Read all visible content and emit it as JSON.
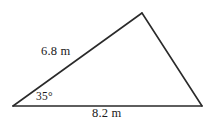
{
  "figure": {
    "kind": "triangle-diagram",
    "background_color": "#ffffff",
    "stroke_color": "#2a2a2a",
    "stroke_width_px": 1.6,
    "labels": {
      "left_side": "6.8 m",
      "bottom_side": "8.2 m",
      "angle": "35°"
    },
    "geometry": {
      "vertices": {
        "left": {
          "x": 13,
          "y": 106
        },
        "apex": {
          "x": 142,
          "y": 13
        },
        "right": {
          "x": 202,
          "y": 106
        }
      },
      "sides": [
        {
          "name": "left-side",
          "from": "left",
          "to": "apex",
          "label": "6.8 m"
        },
        {
          "name": "right-side",
          "from": "apex",
          "to": "right",
          "label": ""
        },
        {
          "name": "bottom-side",
          "from": "left",
          "to": "right",
          "label": "8.2 m"
        }
      ],
      "angles": [
        {
          "at": "left",
          "label": "35°"
        }
      ]
    }
  }
}
